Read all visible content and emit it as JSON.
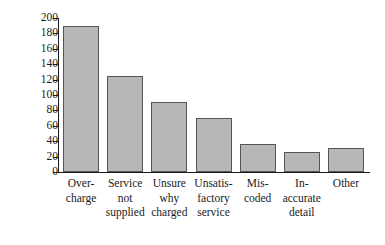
{
  "chart_data": {
    "type": "bar",
    "title": "",
    "subtitle": "",
    "xlabel": "",
    "ylabel": "Number of queries",
    "ylim": [
      0,
      200
    ],
    "ytick_step": 20,
    "yticks": [
      200,
      180,
      160,
      140,
      120,
      100,
      80,
      60,
      40,
      20,
      0
    ],
    "grid": false,
    "legend": false,
    "orientation": "vertical",
    "categories": [
      "Over-charge",
      "Service not supplied",
      "Unsure why charged",
      "Unsatis-factory service",
      "Mis-coded",
      "In-accurate detail",
      "Other"
    ],
    "category_lines": [
      [
        "Over-",
        "charge"
      ],
      [
        "Service",
        "not",
        "supplied"
      ],
      [
        "Unsure",
        "why",
        "charged"
      ],
      [
        "Unsatis-",
        "factory",
        "service"
      ],
      [
        "Mis-",
        "coded"
      ],
      [
        "In-",
        "accurate",
        "detail"
      ],
      [
        "Other"
      ]
    ],
    "values": [
      190,
      125,
      91,
      70,
      36,
      26,
      31
    ],
    "colors": {
      "bar_fill": "#b7b7b7",
      "bar_edge": "#555555",
      "axis": "#1a1a1a",
      "background": "#ffffff",
      "text": "#1a1a1a"
    }
  }
}
